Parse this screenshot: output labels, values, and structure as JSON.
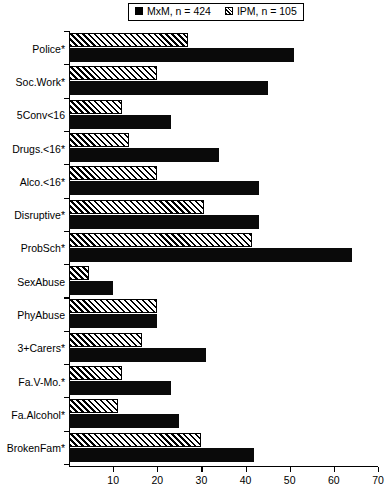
{
  "legend": {
    "position": "top-center",
    "entries": [
      {
        "swatch": "solid-square-icon",
        "label": "MxM, n = 424"
      },
      {
        "swatch": "hatched-square-icon",
        "label": "IPM, n = 105"
      }
    ]
  },
  "chart_data": {
    "type": "bar",
    "orientation": "horizontal",
    "title": "",
    "xlabel": "",
    "ylabel": "",
    "xlim": [
      0,
      70
    ],
    "xticks": [
      0,
      10,
      20,
      30,
      40,
      50,
      60,
      70
    ],
    "grid": false,
    "legend_position": "top-center",
    "categories": [
      "Police*",
      "Soc.Work*",
      "5Conv<16",
      "Drugs.<16*",
      "Alco.<16*",
      "Disruptive*",
      "ProbSch*",
      "SexAbuse",
      "PhyAbuse",
      "3+Carers*",
      "Fa.V-Mo.*",
      "Fa.Alcohol*",
      "BrokenFam*"
    ],
    "series": [
      {
        "name": "MxM, n = 424",
        "style": "solid",
        "color": "#000000",
        "values": [
          51,
          45,
          23,
          34,
          43,
          43,
          64,
          10,
          20,
          31,
          23,
          25,
          42
        ]
      },
      {
        "name": "IPM, n = 105",
        "style": "hatched",
        "color": "#000000",
        "values": [
          27,
          20,
          12,
          13.5,
          20,
          30.5,
          41.5,
          4.5,
          20,
          16.5,
          12,
          11,
          30
        ]
      }
    ]
  }
}
